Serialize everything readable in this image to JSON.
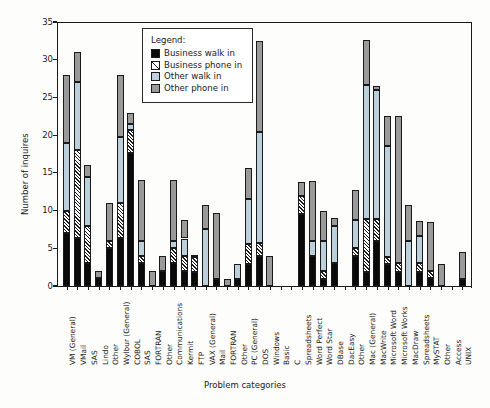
{
  "chart_data": {
    "type": "bar",
    "subtype": "stacked-vertical",
    "title": "",
    "xlabel": "Problem categories",
    "ylabel": "Number of inquires",
    "ylim": [
      0,
      35
    ],
    "yticks": [
      0,
      5,
      10,
      15,
      20,
      25,
      30,
      35
    ],
    "grid": false,
    "legend": {
      "title": "Legend:",
      "position": "inside-top-center",
      "entries": [
        {
          "name": "Business walk in",
          "key": "business_walk_in",
          "color": "#0a0a0a",
          "pattern": "solid-black"
        },
        {
          "name": "Business phone in",
          "key": "business_phone_in",
          "color": "#ffffff",
          "pattern": "diagonal-hatch"
        },
        {
          "name": "Other walk in",
          "key": "other_walk_in",
          "color": "#bcd0dc",
          "pattern": "solid-lightblue"
        },
        {
          "name": "Other phone in",
          "key": "other_phone_in",
          "color": "#9a9a9a",
          "pattern": "solid-gray"
        }
      ]
    },
    "categories": [
      "VM (General)",
      "VMail",
      "SAS",
      "Lindo",
      "Other",
      "Wylbur (General)",
      "COBOL",
      "SAS",
      "FORTRAN",
      "Other",
      "Communications",
      "Kermit",
      "FTP",
      "VAX (General)",
      "Mail",
      "FORTRAN",
      "Other",
      "PC (General)",
      "DOS",
      "Windows",
      "Basic",
      "C",
      "Spreadsheets",
      "Word Perfect",
      "Word Star",
      "DBase",
      "DacEasy",
      "Other",
      "Mac (General)",
      "MacWrite",
      "Microsoft Word",
      "Microsoft Works",
      "MacDraw",
      "Spreadsheets",
      "MySTAT",
      "Other",
      "Access",
      "UNIX"
    ],
    "series": [
      {
        "name": "Business walk in",
        "key": "business_walk_in",
        "values": [
          7.0,
          6.3,
          3.0,
          1.0,
          5.0,
          6.3,
          17.7,
          3.0,
          0.0,
          2.0,
          3.0,
          2.0,
          1.9,
          0.0,
          0.9,
          0.0,
          0.9,
          2.9,
          4.0,
          0.0,
          0.0,
          0.0,
          9.6,
          4.0,
          0.9,
          3.0,
          0.0,
          4.0,
          1.9,
          6.0,
          2.9,
          1.9,
          0.0,
          1.9,
          1.0,
          0.0,
          0.0,
          0.9
        ]
      },
      {
        "name": "Business phone in",
        "key": "business_phone_in",
        "values": [
          3.0,
          11.7,
          5.0,
          0.0,
          1.0,
          4.7,
          3.0,
          1.0,
          0.0,
          0.0,
          2.0,
          2.0,
          1.9,
          0.0,
          0.0,
          0.0,
          0.0,
          2.7,
          1.7,
          0.0,
          0.0,
          0.0,
          2.4,
          0.0,
          1.1,
          0.0,
          0.0,
          1.0,
          7.0,
          2.9,
          1.0,
          1.1,
          0.0,
          1.1,
          1.0,
          0.0,
          0.0,
          0.0
        ]
      },
      {
        "name": "Other walk in",
        "key": "other_walk_in",
        "values": [
          9.0,
          9.0,
          6.5,
          0.0,
          0.0,
          8.7,
          0.8,
          2.0,
          0.0,
          0.0,
          1.0,
          2.3,
          0.2,
          7.5,
          0.0,
          0.0,
          2.0,
          5.9,
          14.7,
          0.0,
          0.0,
          0.0,
          0.0,
          2.0,
          4.0,
          5.0,
          0.0,
          3.7,
          17.7,
          17.1,
          14.6,
          0.0,
          6.0,
          3.6,
          0.0,
          0.0,
          0.0,
          0.0
        ]
      },
      {
        "name": "Other phone in",
        "key": "other_phone_in",
        "values": [
          9.0,
          4.0,
          1.5,
          1.0,
          5.0,
          8.3,
          1.5,
          8.0,
          2.0,
          2.0,
          8.0,
          2.5,
          0.0,
          3.3,
          8.8,
          0.9,
          0.0,
          4.2,
          12.1,
          4.0,
          0.0,
          0.0,
          1.8,
          7.9,
          4.0,
          1.0,
          0.0,
          4.0,
          6.0,
          0.5,
          4.0,
          19.6,
          4.7,
          2.0,
          6.5,
          2.9,
          0.0,
          3.6
        ]
      }
    ],
    "totals": [
      28.0,
      31.0,
      16.0,
      2.0,
      11.0,
      28.0,
      23.0,
      14.0,
      2.0,
      4.0,
      14.0,
      8.8,
      4.0,
      10.8,
      9.7,
      0.9,
      2.9,
      15.7,
      32.5,
      4.0,
      0.0,
      0.0,
      13.8,
      13.9,
      10.0,
      9.0,
      0.0,
      12.7,
      32.6,
      26.5,
      22.5,
      22.6,
      10.7,
      8.6,
      8.5,
      2.9,
      0.0,
      4.5
    ]
  }
}
